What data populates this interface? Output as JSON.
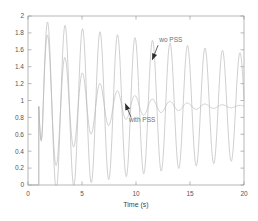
{
  "chart_data": {
    "type": "line",
    "title": "",
    "xlabel": "Time (s)",
    "ylabel": "",
    "xlim": [
      0,
      20
    ],
    "ylim": [
      0,
      2
    ],
    "xticks": [
      0,
      5,
      10,
      15,
      20
    ],
    "xticklabels": [
      "0",
      "5",
      "10",
      "15",
      "20"
    ],
    "yticks": [
      0,
      0.2,
      0.4,
      0.6,
      0.8,
      1,
      1.2,
      1.4,
      1.6,
      1.8,
      2
    ],
    "yticklabels": [
      "0",
      "0.2",
      "0.4",
      "0.6",
      "0.8",
      "1",
      "1.2",
      "1.4",
      "1.6",
      "1.8",
      "2"
    ],
    "grid": false,
    "legend": "none",
    "line_color": "#b9b9b9",
    "line_width": 0.7,
    "steady_state": 0.93,
    "disturbance_time": 1.0,
    "series": [
      {
        "name": "wo PSS",
        "label": "wo PSS",
        "description": "undamped sustained oscillation, very lightly damped",
        "color": "#b9b9b9",
        "model": "oscillatory",
        "start_time": 1.0,
        "settle_value": 0.93,
        "amplitude_initial": 1.02,
        "amplitude_final": 0.63,
        "period": 1.62,
        "phase": 0
      },
      {
        "name": "with PSS",
        "label": "with PSS",
        "description": "well damped oscillation settling quickly to steady state",
        "color": "#b9b9b9",
        "model": "oscillatory",
        "start_time": 1.0,
        "settle_value": 0.93,
        "amplitude_initial": 1.02,
        "amplitude_final": 0.012,
        "period": 1.62,
        "phase": 0,
        "damping": 0.52
      }
    ],
    "annotations": [
      {
        "name": "wo-pss-annotation",
        "text": "wo PSS",
        "text_x": 12.15,
        "text_y": 1.69,
        "arrow_from_x": 12.05,
        "arrow_from_y": 1.655,
        "arrow_to_x": 11.5,
        "arrow_to_y": 1.48
      },
      {
        "name": "with-pss-annotation",
        "text": "with PSS",
        "text_x": 9.35,
        "text_y": 0.745,
        "arrow_from_x": 9.55,
        "arrow_from_y": 0.8,
        "arrow_to_x": 9.0,
        "arrow_to_y": 0.965
      }
    ]
  }
}
